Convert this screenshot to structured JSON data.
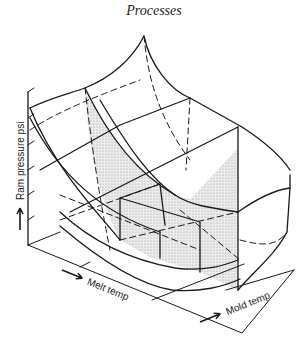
{
  "header": {
    "title": "Processes"
  },
  "diagram": {
    "type": "3d-surface-plot",
    "axes": {
      "vertical": {
        "label": "Ram pressure psi",
        "arrow": "up-arrow"
      },
      "front_left": {
        "label": "Melt temp",
        "arrow": "right-arrow"
      },
      "front_right": {
        "label": "Mold temp",
        "arrow": "right-arrow"
      }
    },
    "colors": {
      "line": "#1a1a1a",
      "shade": "#d9d9d9",
      "background": "#ffffff"
    }
  }
}
